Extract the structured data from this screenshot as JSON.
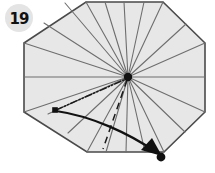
{
  "figure": {
    "kind": "origami-fold-diagram",
    "canvas": {
      "width": 215,
      "height": 173,
      "background": "#ffffff"
    },
    "step_badge": {
      "label": "19",
      "circle_fill": "#e4e4e4",
      "text_color": "#111111",
      "cx": 19,
      "cy": 18,
      "r": 14
    },
    "paper": {
      "name": "octagon-sheet",
      "fill": "#e7e7e7",
      "stroke": "#4a4a4a",
      "stroke_width": 1.6,
      "points": "86,2 163,2 205,43 205,112 164,152 87,152 24,112 24,43"
    },
    "hub": {
      "cx": 128,
      "cy": 77,
      "r": 4.2,
      "color": "#111111"
    },
    "crease_lines": {
      "color": "#6e6e6e",
      "width": 1.1,
      "endpoints": [
        [
          86,
          2
        ],
        [
          105,
          2
        ],
        [
          124,
          2
        ],
        [
          144,
          2
        ],
        [
          163,
          2
        ],
        [
          186,
          24
        ],
        [
          205,
          43
        ],
        [
          205,
          77
        ],
        [
          205,
          112
        ],
        [
          185,
          132
        ],
        [
          164,
          152
        ],
        [
          145,
          152
        ],
        [
          126,
          152
        ],
        [
          106,
          152
        ],
        [
          87,
          152
        ],
        [
          68,
          133
        ],
        [
          48,
          114
        ],
        [
          24,
          112
        ],
        [
          24,
          77
        ],
        [
          24,
          43
        ],
        [
          44,
          23
        ],
        [
          65,
          3
        ]
      ]
    },
    "mountain_fold": {
      "name": "dash-dot-dot-crease",
      "color": "#1a1a1a",
      "width": 1.5,
      "dash": "7 2 1.5 2 1.5 2",
      "from": [
        56,
        110
      ],
      "to": [
        126,
        79
      ]
    },
    "valley_fold": {
      "name": "dashed-crease",
      "color": "#1a1a1a",
      "width": 1.5,
      "dash": "7 5",
      "from": [
        127,
        80
      ],
      "to": [
        103,
        149
      ]
    },
    "fold_arrow": {
      "name": "curved-fold-arrow",
      "color": "#111111",
      "width": 2.2,
      "path": "M 56,111 C 92,116 130,134 156,152",
      "head": "152,138 162,156 141,150"
    },
    "markers": [
      {
        "name": "left-corner-point",
        "cx": 55,
        "cy": 110,
        "size": 5.6,
        "color": "#111111"
      },
      {
        "name": "target-corner-point",
        "cx": 161,
        "cy": 157,
        "r": 4.4,
        "color": "#111111"
      }
    ]
  }
}
